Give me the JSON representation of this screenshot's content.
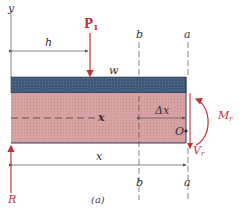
{
  "figure": {
    "caption": "(a)",
    "colors": {
      "beam_top_layer": "#3f5a78",
      "beam_body": "#d9a3a3",
      "force_red": "#c4303a",
      "line_gray": "#555555"
    },
    "labels": {
      "y_axis": "y",
      "load": "P",
      "load_subscript": "1",
      "distance_h": "h",
      "distributed_load": "w",
      "section_b_top": "b",
      "section_a_top": "a",
      "section_b_bottom": "b",
      "section_a_bottom": "a",
      "centerline_x": "x",
      "delta_x": "Δx",
      "point_O": "O",
      "moment": "M",
      "moment_subscript": "r",
      "shear": "V",
      "shear_subscript": "r",
      "reaction": "R",
      "distance_x": "x"
    }
  }
}
